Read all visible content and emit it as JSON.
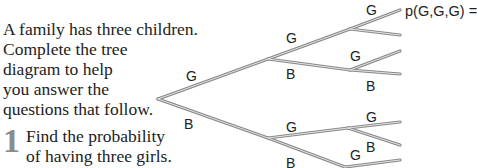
{
  "intro": {
    "lines": [
      "A family has three children.",
      "Complete the tree",
      "diagram to help",
      "you answer the",
      "questions that follow."
    ]
  },
  "question1": {
    "number": "1",
    "lines": [
      "Find the probability",
      "of having three girls."
    ]
  },
  "tree": {
    "level1": {
      "upper": "G",
      "lower": "B"
    },
    "level2": {
      "upper_g": "G",
      "upper_b": "B",
      "lower_g": "G",
      "lower_b": "B"
    },
    "level3": {
      "gg_g": "G",
      "gb_g": "G",
      "gb_b": "B",
      "bg_g": "G",
      "bg_b": "B",
      "bb_g": "G"
    },
    "result_label": "p(G,G,G) ="
  },
  "colors": {
    "line": "#8a8a8a",
    "numeral": "#8c8c8c",
    "text": "#222222"
  }
}
